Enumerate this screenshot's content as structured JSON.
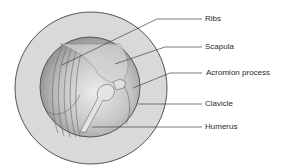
{
  "diagram": {
    "labels": [
      {
        "text": "Ribs",
        "x": 205,
        "y": 14
      },
      {
        "text": "Scapula",
        "x": 205,
        "y": 42
      },
      {
        "text": "Acromion process",
        "x": 206,
        "y": 68
      },
      {
        "text": "Clavicle",
        "x": 205,
        "y": 99
      },
      {
        "text": "Humerus",
        "x": 205,
        "y": 122
      }
    ],
    "colors": {
      "outer_ring": "#d9d9d9",
      "outline": "#555555",
      "sphere_light": "#e8e8e8",
      "sphere_dark": "#8a8a8a",
      "leader": "#444444"
    }
  }
}
